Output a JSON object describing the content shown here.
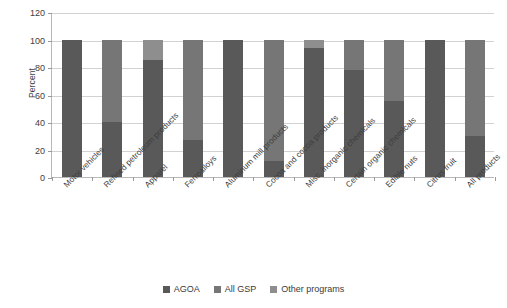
{
  "chart_data": {
    "type": "bar",
    "stacked": true,
    "stack_total": 100,
    "title": "",
    "xlabel": "",
    "ylabel": "Percent",
    "ylim": [
      0,
      120
    ],
    "yticks": [
      0,
      20,
      40,
      60,
      80,
      100,
      120
    ],
    "grid": true,
    "legend_position": "bottom",
    "categories": [
      "Motor vehicles",
      "Refined petroleum products",
      "Apparel",
      "Ferroalloys",
      "Aluminum mill products",
      "Cocoa and cocoa products",
      "Misc. inorganic chemicals",
      "Certain organic chemicals",
      "Edible nuts",
      "Citrus fruit",
      "All products"
    ],
    "series": [
      {
        "name": "AGOA",
        "color": "#595959",
        "values": [
          100,
          40,
          85,
          27,
          100,
          12,
          94,
          78,
          55,
          100,
          30
        ]
      },
      {
        "name": "All GSP",
        "color": "#767676",
        "values": [
          0,
          60,
          0,
          73,
          0,
          88,
          0,
          22,
          45,
          0,
          70
        ]
      },
      {
        "name": "Other programs",
        "color": "#8e8e8e",
        "values": [
          0,
          0,
          15,
          0,
          0,
          0,
          6,
          0,
          0,
          0,
          0
        ]
      }
    ]
  },
  "axis": {
    "y_title": "Percent",
    "y_tick_labels": [
      "0",
      "20",
      "40",
      "60",
      "80",
      "100",
      "120"
    ]
  },
  "legend": {
    "items": [
      {
        "label": "AGOA",
        "color": "#595959"
      },
      {
        "label": "All GSP",
        "color": "#767676"
      },
      {
        "label": "Other programs",
        "color": "#8e8e8e"
      }
    ]
  }
}
